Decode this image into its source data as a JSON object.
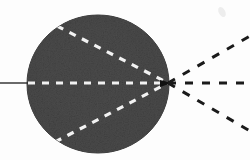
{
  "figure": {
    "caption": "",
    "background_color": "#fdfdfd",
    "canvas": {
      "width": 250,
      "height": 160
    }
  },
  "body": {
    "name": "dark-sphere",
    "shape": "circle",
    "center_x": 98,
    "center_y": 84,
    "radius_x": 71,
    "radius_y": 69,
    "fill_color": "#4b4b4b",
    "edge_color": "#3a3a3a",
    "texture": "halftone-grain"
  },
  "focus": {
    "name": "focal-point",
    "x": 168,
    "y": 83,
    "color": "#111111"
  },
  "incoming_axis": {
    "name": "optical-axis-incoming",
    "style": "solid",
    "color": "#2a2a2a",
    "x1": 0,
    "y1": 83,
    "x2": 28,
    "y2": 83,
    "stroke_width": 1.4
  },
  "internal_rays": {
    "style": "dashed",
    "color": "#f2f2f2",
    "stroke_width": 3.2,
    "dash": "7 7",
    "items": [
      {
        "name": "internal-ray-upper",
        "x1": 57,
        "y1": 26,
        "x2": 168,
        "y2": 83
      },
      {
        "name": "internal-ray-axis",
        "x1": 28,
        "y1": 83,
        "x2": 168,
        "y2": 83
      },
      {
        "name": "internal-ray-lower",
        "x1": 55,
        "y1": 142,
        "x2": 168,
        "y2": 83
      }
    ]
  },
  "external_rays": {
    "style": "dashed",
    "color": "#1a1a1a",
    "stroke_width": 3.0,
    "dash": "8 9",
    "items": [
      {
        "name": "external-ray-upper",
        "x1": 168,
        "y1": 83,
        "x2": 250,
        "y2": 36
      },
      {
        "name": "external-ray-axis",
        "x1": 168,
        "y1": 83,
        "x2": 250,
        "y2": 83
      },
      {
        "name": "external-ray-lower",
        "x1": 168,
        "y1": 83,
        "x2": 250,
        "y2": 131
      }
    ]
  },
  "speck": {
    "name": "scan-speck",
    "x": 222,
    "y": 12,
    "color": "#ededed"
  },
  "chart_data": {
    "type": "scatter",
    "xlabel": "",
    "ylabel": "",
    "xlim": [
      0,
      250
    ],
    "ylim": [
      0,
      160
    ],
    "grid": false,
    "legend": "none",
    "annotations": [
      "solid incoming axis ray from left edge to sphere surface",
      "three white dashed rays converge inside the dark sphere",
      "three black dashed rays diverge to the right of the focal point"
    ],
    "series": [
      {
        "name": "focal-point",
        "x": [
          168
        ],
        "y": [
          83
        ]
      },
      {
        "name": "internal-ray-endpoints",
        "x": [
          57,
          28,
          55
        ],
        "y": [
          26,
          83,
          142
        ]
      },
      {
        "name": "external-ray-endpoints",
        "x": [
          250,
          250,
          250
        ],
        "y": [
          36,
          83,
          131
        ]
      }
    ]
  }
}
